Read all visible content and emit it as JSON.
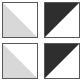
{
  "figure": {
    "background_color": "#ffffff",
    "grid": {
      "rows": 2,
      "columns": 2,
      "tile_count": 4
    },
    "palette": {
      "border": "#58585a",
      "light_fill": "#d8d8d8",
      "dark_fill": "#2e2e2e",
      "empty_fill": "#ffffff"
    },
    "tiles": [
      {
        "id": "tile-top-left",
        "position": "top-left",
        "diagonal": "top-right-to-bottom-left",
        "filled_half": "lower-left",
        "fill_color": "#d8d8d8",
        "empty_color": "#ffffff",
        "border_color": "#58585a",
        "shade": "light"
      },
      {
        "id": "tile-top-right",
        "position": "top-right",
        "diagonal": "top-right-to-bottom-left",
        "filled_half": "upper-left",
        "fill_color": "#2e2e2e",
        "empty_color": "#ffffff",
        "border_color": "#58585a",
        "shade": "dark"
      },
      {
        "id": "tile-bottom-left",
        "position": "bottom-left",
        "diagonal": "top-right-to-bottom-left",
        "filled_half": "lower-left",
        "fill_color": "#d8d8d8",
        "empty_color": "#ffffff",
        "border_color": "#58585a",
        "shade": "light"
      },
      {
        "id": "tile-bottom-right",
        "position": "bottom-right",
        "diagonal": "top-right-to-bottom-left",
        "filled_half": "upper-left",
        "fill_color": "#2e2e2e",
        "empty_color": "#ffffff",
        "border_color": "#58585a",
        "shade": "dark"
      }
    ]
  }
}
